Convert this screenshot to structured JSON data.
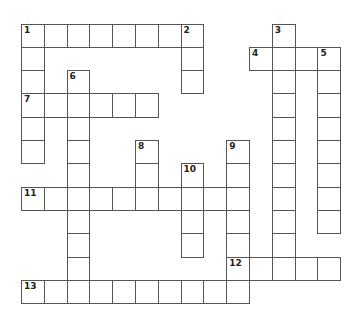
{
  "puzzle": {
    "origin_x": 21.5,
    "origin_y": 24,
    "cell_w": 22.8,
    "cell_h": 23.3,
    "entries": [
      {
        "number": "1",
        "direction": "across",
        "row": 0,
        "col": 0,
        "length": 8
      },
      {
        "number": "1",
        "direction": "down",
        "row": 0,
        "col": 0,
        "length": 6
      },
      {
        "number": "2",
        "direction": "down",
        "row": 0,
        "col": 7,
        "length": 3
      },
      {
        "number": "3",
        "direction": "down",
        "row": 0,
        "col": 11,
        "length": 11
      },
      {
        "number": "4",
        "direction": "across",
        "row": 1,
        "col": 10,
        "length": 4
      },
      {
        "number": "5",
        "direction": "down",
        "row": 1,
        "col": 13,
        "length": 8
      },
      {
        "number": "6",
        "direction": "down",
        "row": 2,
        "col": 2,
        "length": 9
      },
      {
        "number": "7",
        "direction": "across",
        "row": 3,
        "col": 0,
        "length": 6
      },
      {
        "number": "8",
        "direction": "down",
        "row": 5,
        "col": 5,
        "length": 3
      },
      {
        "number": "9",
        "direction": "down",
        "row": 5,
        "col": 9,
        "length": 7
      },
      {
        "number": "10",
        "direction": "down",
        "row": 6,
        "col": 7,
        "length": 4
      },
      {
        "number": "11",
        "direction": "across",
        "row": 7,
        "col": 0,
        "length": 10
      },
      {
        "number": "12",
        "direction": "across",
        "row": 10,
        "col": 9,
        "length": 5
      },
      {
        "number": "13",
        "direction": "across",
        "row": 11,
        "col": 0,
        "length": 10
      }
    ]
  }
}
